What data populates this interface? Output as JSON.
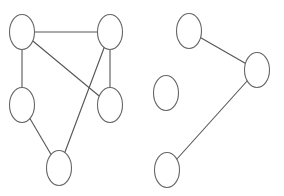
{
  "diagram": {
    "type": "undirected-graph",
    "background": "#ffffff",
    "node_stroke": "#666666",
    "edge_stroke": "#555555",
    "node_radius": {
      "rx": 12.5,
      "ry": 17.5
    },
    "graphs": [
      {
        "id": "left-graph",
        "nodes": [
          {
            "id": "A",
            "x": 22,
            "y": 32
          },
          {
            "id": "B",
            "x": 110,
            "y": 32
          },
          {
            "id": "C",
            "x": 22,
            "y": 105
          },
          {
            "id": "D",
            "x": 110,
            "y": 105
          },
          {
            "id": "E",
            "x": 59,
            "y": 168
          }
        ],
        "edges": [
          [
            "A",
            "B"
          ],
          [
            "A",
            "C"
          ],
          [
            "A",
            "D"
          ],
          [
            "B",
            "D"
          ],
          [
            "B",
            "E"
          ],
          [
            "C",
            "E"
          ]
        ]
      },
      {
        "id": "right-graph",
        "nodes": [
          {
            "id": "F",
            "x": 189,
            "y": 31
          },
          {
            "id": "G",
            "x": 257,
            "y": 70
          },
          {
            "id": "H",
            "x": 166,
            "y": 93
          },
          {
            "id": "I",
            "x": 167,
            "y": 170
          }
        ],
        "edges": [
          [
            "F",
            "G"
          ],
          [
            "G",
            "I"
          ]
        ]
      }
    ]
  }
}
